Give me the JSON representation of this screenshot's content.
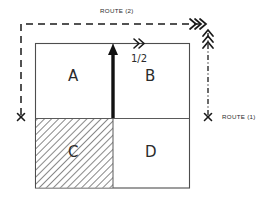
{
  "diagram": {
    "title_top": "ROUTE (2)",
    "title_right": "ROUTE (1)",
    "fraction_label": "1/2",
    "quadrants": [
      {
        "key": "A",
        "label": "A",
        "fill": "none",
        "position": "top-left"
      },
      {
        "key": "B",
        "label": "B",
        "fill": "none",
        "position": "top-right"
      },
      {
        "key": "C",
        "label": "C",
        "fill": "hatched",
        "position": "bottom-left"
      },
      {
        "key": "D",
        "label": "D",
        "fill": "none",
        "position": "bottom-right"
      }
    ],
    "markers": {
      "left_cross": "x",
      "right_cross": "x"
    },
    "arrows": {
      "main_up": "thick-up-arrow",
      "top_edge_chevron": "double-chevron-right",
      "route2_end_chevron": "triple-chevron-right",
      "route1_end_chevron": "triple-chevron-up"
    },
    "colors": {
      "stroke": "#1a1a1a",
      "box_stroke": "#4d4d4d",
      "hatch": "#555555",
      "background": "#ffffff"
    },
    "line_styles": {
      "route2": "dashed",
      "route1": "dash-dot",
      "box": "solid"
    }
  }
}
